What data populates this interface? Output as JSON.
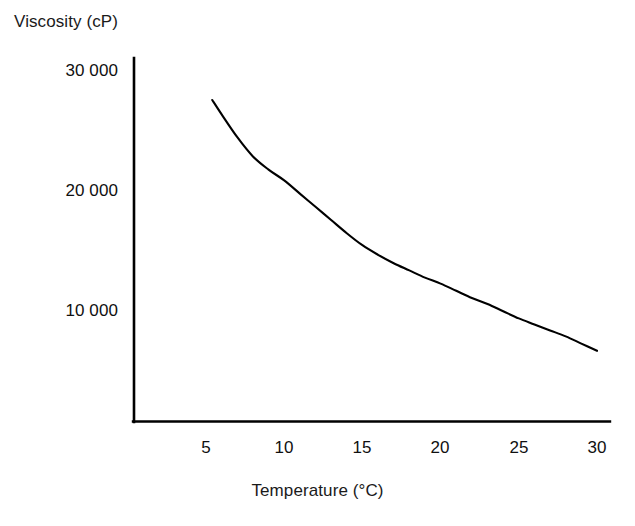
{
  "chart_data": {
    "type": "line",
    "title": "",
    "subtitle": "",
    "xlabel": "Temperature (°C)",
    "ylabel": "Viscosity (cP)",
    "xlim": [
      0,
      31.5
    ],
    "ylim": [
      0,
      32000
    ],
    "xticks": [
      5,
      10,
      15,
      20,
      25,
      30
    ],
    "xtick_labels": [
      "5",
      "10",
      "15",
      "20",
      "25",
      "30"
    ],
    "yticks": [
      10000,
      20000,
      30000
    ],
    "ytick_labels": [
      "10 000",
      "20 000",
      "30 000"
    ],
    "grid": false,
    "legend": null,
    "line_color": "#000000",
    "background_color": "#ffffff",
    "axis_color": "#000000",
    "series": [
      {
        "name": "viscosity",
        "x": [
          5.4,
          6,
          7,
          8,
          9,
          10,
          11,
          12,
          13,
          14,
          15,
          16,
          17,
          18,
          19,
          20,
          21,
          22,
          23,
          24,
          25,
          26,
          27,
          28,
          29,
          30
        ],
        "values": [
          27500,
          26300,
          24400,
          22800,
          21700,
          20800,
          19700,
          18600,
          17500,
          16400,
          15400,
          14600,
          13900,
          13300,
          12700,
          12200,
          11600,
          11000,
          10500,
          9900,
          9300,
          8800,
          8300,
          7800,
          7200,
          6600
        ]
      }
    ],
    "annotations": []
  },
  "axes": {
    "y_axis_label": "Viscosity (cP)",
    "x_axis_label": "Temperature (°C)",
    "y_tick_labels": [
      "30 000",
      "20 000",
      "10 000"
    ],
    "x_tick_labels": [
      "5",
      "10",
      "15",
      "20",
      "25",
      "30"
    ]
  }
}
